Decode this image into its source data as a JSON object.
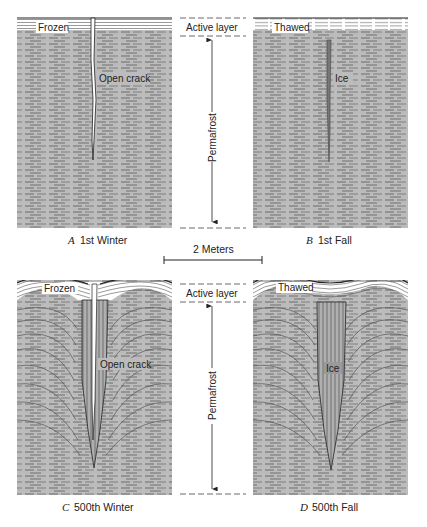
{
  "figure": {
    "panels": [
      {
        "id": "A",
        "letter": "A",
        "caption": "1st Winter",
        "surface_label": "Frozen",
        "feature_label": "Open crack",
        "stage": "1st Winter"
      },
      {
        "id": "B",
        "letter": "B",
        "caption": "1st Fall",
        "surface_label": "Thawed",
        "feature_label": "Ice",
        "stage": "1st Fall"
      },
      {
        "id": "C",
        "letter": "C",
        "caption": "500th Winter",
        "surface_label": "Frozen",
        "feature_label": "Open crack",
        "stage": "500th Winter"
      },
      {
        "id": "D",
        "letter": "D",
        "caption": "500th Fall",
        "surface_label": "Thawed",
        "feature_label": "Ice",
        "stage": "500th Fall"
      }
    ],
    "annotations": {
      "top": {
        "active_layer": "Active layer",
        "permafrost": "Permafrost"
      },
      "bottom": {
        "active_layer": "Active layer",
        "permafrost": "Permafrost"
      }
    },
    "scale_bar": {
      "label": "2 Meters"
    }
  },
  "colors": {
    "soil": "#b8b8b8",
    "soil_line": "#555555",
    "active_layer_bg": "#ffffff",
    "active_layer_line": "#444444",
    "ice": "#8f8f8f",
    "ice_dark": "#666666",
    "ink": "#222222"
  }
}
